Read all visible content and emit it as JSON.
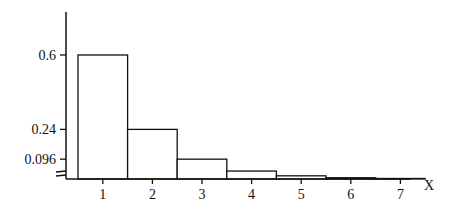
{
  "chart_data": {
    "type": "bar",
    "title": "",
    "xlabel": "X",
    "ylabel": "",
    "categories": [
      "1",
      "2",
      "3",
      "4",
      "5",
      "6",
      "7"
    ],
    "values": [
      0.6,
      0.24,
      0.096,
      0.0384,
      0.01536,
      0.006144,
      0.0024576
    ],
    "ytick_labels": [
      "0.6",
      "0.24",
      "0.096"
    ],
    "ytick_values": [
      0.6,
      0.24,
      0.096
    ],
    "axis_break": true,
    "grid": false,
    "legend": null
  }
}
